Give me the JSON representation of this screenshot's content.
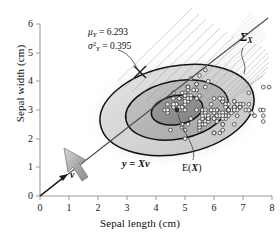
{
  "figure": {
    "background": "#ffffff",
    "caption_present": false
  },
  "axes": {
    "x": {
      "label": "Sepal length (cm)",
      "ticks": [
        "0",
        "1",
        "2",
        "3",
        "4",
        "5",
        "6",
        "7",
        "8"
      ],
      "min": 0,
      "max": 8,
      "color": "#8a8a8a"
    },
    "y": {
      "label": "Sepal width (cm)",
      "ticks": [
        "0",
        "1",
        "2",
        "3",
        "4",
        "5",
        "6"
      ],
      "min": 0,
      "max": 6,
      "color": "#8a8a8a"
    }
  },
  "annotations": {
    "mu_symbol": "μ",
    "mu_subscript": "Y",
    "mu_eq": "= 6.293",
    "sigma_symbol": "σ",
    "sigma_sup": "2",
    "sigma_subscript": "Y",
    "sigma_eq": "= 0.395",
    "covariance_symbol": "Σ",
    "covariance_subscript": "X",
    "projection_equation_y": "y",
    "projection_equation_eq": "= ",
    "projection_equation_X": "X",
    "projection_equation_v": "v",
    "expectation_label_E": "E(",
    "expectation_label_X": "X",
    "expectation_label_close": ")",
    "vector_label": "v"
  },
  "chart_data": {
    "type": "scatter",
    "title": "",
    "xlabel": "Sepal length (cm)",
    "ylabel": "Sepal width (cm)",
    "xlim": [
      0,
      8
    ],
    "ylim": [
      0,
      6
    ],
    "grid": false,
    "legend": "none",
    "mean": {
      "x": 5.84,
      "y": 3.06
    },
    "mu_Y": 6.293,
    "sigma2_Y": 0.395,
    "contours": {
      "description": "three concentric confidence ellipses of the bivariate normal fit, shaded grayscale",
      "levels": [
        1,
        2,
        3
      ],
      "center": [
        5.84,
        3.06
      ],
      "angle_deg": -12,
      "semi_axes": [
        [
          0.85,
          0.45
        ],
        [
          1.7,
          0.9
        ],
        [
          2.55,
          1.35
        ]
      ],
      "fill_colors": [
        "#8e8e8e",
        "#b5b5b5",
        "#d6d6d6"
      ],
      "stroke": "#111111"
    },
    "projection_line": {
      "label": "y = Xv",
      "through_origin": true,
      "slope": 0.78,
      "color": "#4a4a4a"
    },
    "points_x": [
      5.1,
      4.9,
      4.7,
      4.6,
      5.0,
      5.4,
      4.6,
      5.0,
      4.4,
      4.9,
      5.4,
      4.8,
      4.8,
      4.3,
      5.8,
      5.7,
      5.4,
      5.1,
      5.7,
      5.1,
      5.4,
      5.1,
      4.6,
      5.1,
      4.8,
      5.0,
      5.0,
      5.2,
      5.2,
      4.7,
      4.8,
      5.4,
      5.2,
      5.5,
      4.9,
      5.0,
      5.5,
      4.9,
      4.4,
      5.1,
      5.0,
      4.5,
      4.4,
      5.0,
      5.1,
      4.8,
      5.1,
      4.6,
      5.3,
      5.0,
      7.0,
      6.4,
      6.9,
      5.5,
      6.5,
      5.7,
      6.3,
      4.9,
      6.6,
      5.2,
      5.0,
      5.9,
      6.0,
      6.1,
      5.6,
      6.7,
      5.6,
      5.8,
      6.2,
      5.6,
      5.9,
      6.1,
      6.3,
      6.1,
      6.4,
      6.6,
      6.8,
      6.7,
      6.0,
      5.7,
      5.5,
      5.5,
      5.8,
      6.0,
      5.4,
      6.0,
      6.7,
      6.3,
      5.6,
      5.5,
      5.5,
      6.1,
      5.8,
      5.0,
      5.6,
      5.7,
      5.7,
      6.2,
      5.1,
      5.7,
      6.3,
      5.8,
      7.1,
      6.3,
      6.5,
      7.6,
      4.9,
      7.3,
      6.7,
      7.2,
      6.5,
      6.4,
      6.8,
      5.7,
      5.8,
      6.4,
      6.5,
      7.7,
      7.7,
      6.0,
      6.9,
      5.6,
      7.7,
      6.3,
      6.7,
      7.2,
      6.2,
      6.1,
      6.4,
      7.2,
      7.4,
      7.9,
      6.4,
      6.3,
      6.1,
      7.7,
      6.3,
      6.4,
      6.0,
      6.9,
      6.7,
      6.9,
      5.8,
      6.8,
      6.7,
      6.7,
      6.3,
      6.5,
      6.2,
      5.9
    ],
    "points_y": [
      3.5,
      3.0,
      3.2,
      3.1,
      3.6,
      3.9,
      3.4,
      3.4,
      2.9,
      3.1,
      3.7,
      3.4,
      3.0,
      3.0,
      4.0,
      4.4,
      3.9,
      3.5,
      3.8,
      3.8,
      3.4,
      3.7,
      3.6,
      3.3,
      3.4,
      3.0,
      3.4,
      3.5,
      3.4,
      3.2,
      3.1,
      3.4,
      4.1,
      4.2,
      3.1,
      3.2,
      3.5,
      3.6,
      3.0,
      3.4,
      3.5,
      2.3,
      3.2,
      3.5,
      3.8,
      3.0,
      3.8,
      3.2,
      3.7,
      3.3,
      3.2,
      3.2,
      3.1,
      2.3,
      2.8,
      2.8,
      3.3,
      2.4,
      2.9,
      2.7,
      2.0,
      3.0,
      2.2,
      2.9,
      2.9,
      3.1,
      3.0,
      2.7,
      2.2,
      2.5,
      3.2,
      2.8,
      2.5,
      2.8,
      2.9,
      3.0,
      2.8,
      3.0,
      2.9,
      2.6,
      2.4,
      2.4,
      2.7,
      2.7,
      3.0,
      3.4,
      3.1,
      2.3,
      3.0,
      2.5,
      2.6,
      3.0,
      2.6,
      2.3,
      2.7,
      3.0,
      2.9,
      2.9,
      2.5,
      2.8,
      3.3,
      2.7,
      3.0,
      2.9,
      3.0,
      3.0,
      2.5,
      2.9,
      2.5,
      3.6,
      3.2,
      2.7,
      3.0,
      2.5,
      2.8,
      3.2,
      3.0,
      3.8,
      2.6,
      2.2,
      3.2,
      2.8,
      2.8,
      2.7,
      3.3,
      3.2,
      2.8,
      3.0,
      2.8,
      3.0,
      2.8,
      3.8,
      2.8,
      2.8,
      2.6,
      3.0,
      3.4,
      3.1,
      3.0,
      3.1,
      3.1,
      3.1,
      2.7,
      3.2,
      3.3,
      3.0,
      2.5,
      3.0,
      3.4,
      3.0
    ]
  }
}
